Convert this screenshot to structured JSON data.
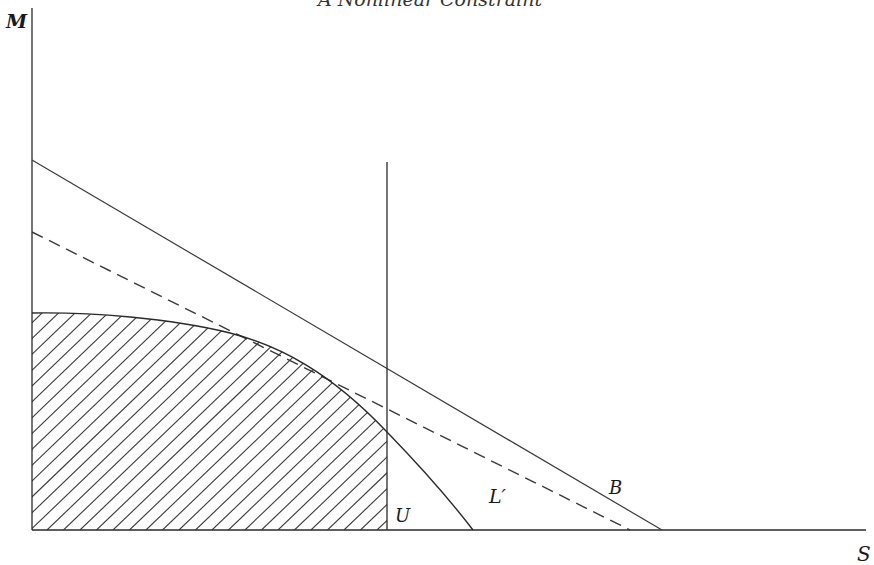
{
  "title": "A Nonlinear Constraint",
  "axes": {
    "y_label": "M",
    "x_label": "S"
  },
  "labels": {
    "vertical_line": "U",
    "curve": "L′",
    "budget_line": "B"
  },
  "elements": [
    {
      "name": "budget-line-B",
      "style": "solid",
      "from": [
        32,
        160
      ],
      "to": [
        662,
        530
      ]
    },
    {
      "name": "tangent-line",
      "style": "dashed",
      "from": [
        32,
        232
      ],
      "to": [
        630,
        530
      ]
    },
    {
      "name": "vertical-line-U",
      "style": "solid",
      "x": 387,
      "from_y": 162,
      "to_y": 530
    },
    {
      "name": "curve-L-prime",
      "style": "solid",
      "points": [
        [
          32,
          313
        ],
        [
          150,
          319
        ],
        [
          230,
          333
        ],
        [
          300,
          362
        ],
        [
          387,
          432
        ],
        [
          473,
          530
        ]
      ]
    },
    {
      "name": "hatched-region",
      "style": "diagonal hatch",
      "bounded_by": [
        "y-axis",
        "x-axis",
        "curve-L-prime",
        "vertical-line-U"
      ]
    }
  ],
  "colors": {
    "background": "#ffffff",
    "ink": "#2a2a2a"
  }
}
